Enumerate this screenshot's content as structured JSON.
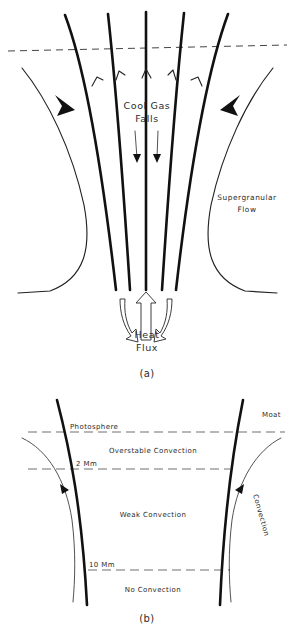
{
  "figure": {
    "title_faint": "",
    "panels": [
      {
        "id": "a",
        "caption": "(a)",
        "labels": {
          "cool_gas_line1": "Cool Gas",
          "cool_gas_line2": "Falls",
          "heat_flux_line1": "Heat",
          "heat_flux_line2": "Flux",
          "supergranular_line1": "Supergranular",
          "supergranular_line2": "Flow"
        }
      },
      {
        "id": "b",
        "caption": "(b)",
        "labels": {
          "photosphere": "Photosphere",
          "overstable": "Overstable Convection",
          "depth_2mm": "2 Mm",
          "weak": "Weak Convection",
          "depth_10mm": "10 Mm",
          "no_convection": "No Convection",
          "moat": "Moat",
          "convection": "Convection"
        }
      }
    ]
  },
  "colors": {
    "ink": "#111111",
    "ink_soft": "#333333",
    "dash": "#555555",
    "background": "#ffffff"
  }
}
